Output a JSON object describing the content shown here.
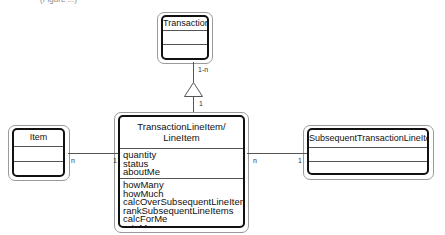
{
  "caption_fragment": "(Figure ...)",
  "classes": {
    "transaction": {
      "name": "Transaction",
      "attributes": [],
      "methods": []
    },
    "line_item": {
      "name_line1": "TransactionLineItem/",
      "name_line2": "LineItem",
      "attributes": [
        "quantity",
        "status",
        "aboutMe"
      ],
      "methods": [
        "howMany",
        "howMuch",
        "calcOverSubsequentLineItems",
        "rankSubsequentLineItems",
        "calcForMe",
        "rateMe"
      ]
    },
    "item": {
      "name": "Item",
      "attributes": [],
      "methods": []
    },
    "subsequent": {
      "name": "SubsequentTransactionLineItem",
      "attributes": [],
      "methods": []
    }
  },
  "associations": {
    "transaction_to_line_item": {
      "kind": "generalization-triangle",
      "top_label": "1-n",
      "bottom_label": "1"
    },
    "item_to_line_item": {
      "left_label": "n",
      "right_label": "1"
    },
    "line_item_to_subsequent": {
      "left_label": "n",
      "right_label": "1"
    }
  },
  "colors": {
    "line": "#555555",
    "box_border": "#111111",
    "shadow_border": "#9a9a9a"
  }
}
